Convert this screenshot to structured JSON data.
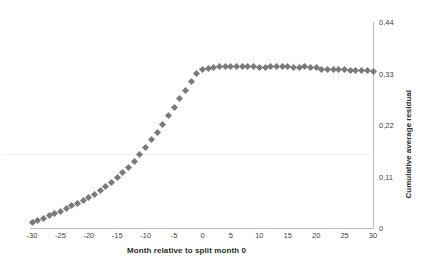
{
  "chart_data": {
    "type": "scatter",
    "title": "",
    "xlabel": "Month relative to split month 0",
    "ylabel": "Cumulative average residual",
    "xlim": [
      -30,
      30
    ],
    "ylim": [
      0,
      0.44
    ],
    "grid": false,
    "legend": null,
    "marker": {
      "shape": "diamond",
      "color": "#7a7a7a",
      "size": 5
    },
    "decimal_separator": ",",
    "xticks": [
      -30,
      -25,
      -20,
      -15,
      -10,
      -5,
      0,
      5,
      10,
      15,
      20,
      25,
      30
    ],
    "xtick_labels": [
      "-30",
      "-25",
      "-20",
      "-15",
      "-10",
      "-5",
      "0",
      "5",
      "10",
      "15",
      "20",
      "25",
      "30"
    ],
    "yticks": [
      0,
      0.11,
      0.22,
      0.33,
      0.44
    ],
    "ytick_labels": [
      "0",
      "0,11",
      "0,22",
      "0,33",
      "0,44"
    ],
    "y_axis_position": "right",
    "x": [
      -30,
      -29,
      -28,
      -27,
      -26,
      -25,
      -24,
      -23,
      -22,
      -21,
      -20,
      -19,
      -18,
      -17,
      -16,
      -15,
      -14,
      -13,
      -12,
      -11,
      -10,
      -9,
      -8,
      -7,
      -6,
      -5,
      -4,
      -3,
      -2,
      -1,
      0,
      1,
      2,
      3,
      4,
      5,
      6,
      7,
      8,
      9,
      10,
      11,
      12,
      13,
      14,
      15,
      16,
      17,
      18,
      19,
      20,
      21,
      22,
      23,
      24,
      25,
      26,
      27,
      28,
      29,
      30
    ],
    "values": [
      0.012,
      0.016,
      0.021,
      0.026,
      0.031,
      0.036,
      0.042,
      0.047,
      0.053,
      0.059,
      0.065,
      0.072,
      0.08,
      0.088,
      0.097,
      0.107,
      0.118,
      0.13,
      0.143,
      0.157,
      0.172,
      0.188,
      0.205,
      0.222,
      0.24,
      0.258,
      0.276,
      0.294,
      0.312,
      0.331,
      0.339,
      0.341,
      0.343,
      0.344,
      0.345,
      0.346,
      0.346,
      0.345,
      0.344,
      0.344,
      0.343,
      0.343,
      0.344,
      0.344,
      0.345,
      0.344,
      0.343,
      0.343,
      0.344,
      0.343,
      0.342,
      0.339,
      0.339,
      0.339,
      0.338,
      0.338,
      0.336,
      0.336,
      0.336,
      0.336,
      0.335
    ]
  }
}
